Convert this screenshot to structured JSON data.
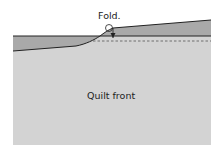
{
  "diagram": {
    "fold_label": "Fold.",
    "quilt_label": "Quilt front",
    "colors": {
      "quilt": "#d3d3d3",
      "binding": "#a9a9a9",
      "line": "#222222",
      "background": "#ffffff"
    }
  }
}
